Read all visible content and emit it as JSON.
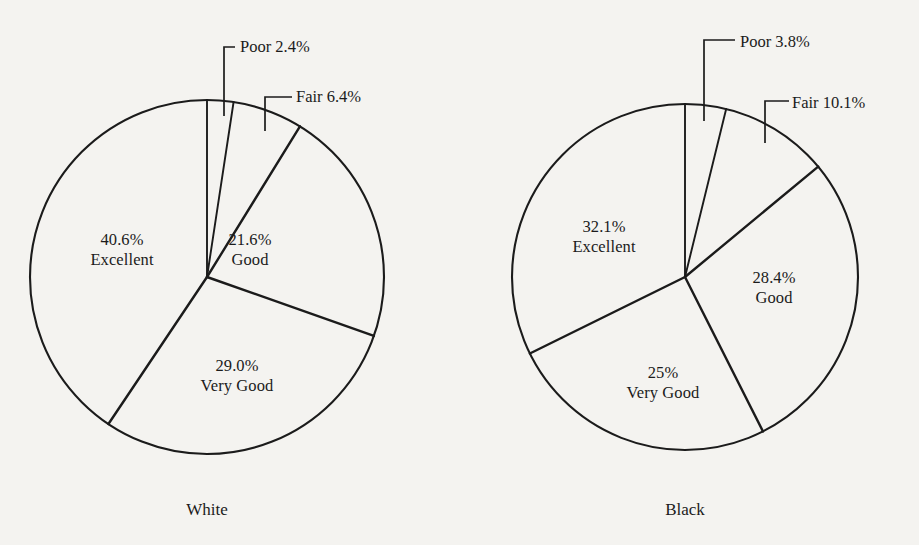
{
  "colors": {
    "background": "#f4f3f0",
    "ink": "#1b1b1b"
  },
  "chart_data": {
    "type": "pie",
    "title": "",
    "subtitle": "",
    "xlabel": "",
    "ylabel": "",
    "legend_position": "none",
    "grid": false,
    "note": "Two side-by-side pie charts of self-reported health status by race; slices ordered clockwise starting at 12 o'clock.",
    "charts": [
      {
        "caption": "White",
        "center": {
          "x": 207,
          "y": 277
        },
        "radius": 177,
        "start_angle_deg": 0,
        "direction": "clockwise",
        "categories": [
          "Poor",
          "Fair",
          "Good",
          "Very Good",
          "Excellent"
        ],
        "values": [
          2.4,
          6.4,
          21.6,
          29.0,
          40.6
        ],
        "slices": [
          {
            "name": "Poor",
            "value": 2.4,
            "value_label": "2.4%",
            "label_style": "callout"
          },
          {
            "name": "Fair",
            "value": 6.4,
            "value_label": "6.4%",
            "label_style": "callout"
          },
          {
            "name": "Good",
            "value": 21.6,
            "value_label": "21.6%",
            "label_style": "inside"
          },
          {
            "name": "Very Good",
            "value": 29.0,
            "value_label": "29.0%",
            "label_style": "inside"
          },
          {
            "name": "Excellent",
            "value": 40.6,
            "value_label": "40.6%",
            "label_style": "inside"
          }
        ],
        "inside_labels": [
          {
            "pct": "40.6%",
            "name": "Excellent",
            "x": 122,
            "y": 250
          },
          {
            "pct": "21.6%",
            "name": "Good",
            "x": 250,
            "y": 250
          },
          {
            "pct": "29.0%",
            "name": "Very Good",
            "x": 237,
            "y": 376
          }
        ],
        "callouts": [
          {
            "text": "Poor 2.4%",
            "x": 240,
            "y": 38
          },
          {
            "text": "Fair 6.4%",
            "x": 296,
            "y": 88
          }
        ]
      },
      {
        "caption": "Black",
        "center": {
          "x": 685,
          "y": 277
        },
        "radius": 173,
        "start_angle_deg": 0,
        "direction": "clockwise",
        "categories": [
          "Poor",
          "Fair",
          "Good",
          "Very Good",
          "Excellent"
        ],
        "values": [
          3.8,
          10.1,
          28.4,
          25.0,
          32.1
        ],
        "slices": [
          {
            "name": "Poor",
            "value": 3.8,
            "value_label": "3.8%",
            "label_style": "callout"
          },
          {
            "name": "Fair",
            "value": 10.1,
            "value_label": "10.1%",
            "label_style": "callout"
          },
          {
            "name": "Good",
            "value": 28.4,
            "value_label": "28.4%",
            "label_style": "inside"
          },
          {
            "name": "Very Good",
            "value": 25.0,
            "value_label": "25%",
            "label_style": "inside"
          },
          {
            "name": "Excellent",
            "value": 32.1,
            "value_label": "32.1%",
            "label_style": "inside"
          }
        ],
        "inside_labels": [
          {
            "pct": "32.1%",
            "name": "Excellent",
            "x": 604,
            "y": 237
          },
          {
            "pct": "28.4%",
            "name": "Good",
            "x": 774,
            "y": 288
          },
          {
            "pct": "25%",
            "name": "Very Good",
            "x": 663,
            "y": 383
          }
        ],
        "callouts": [
          {
            "text": "Poor 3.8%",
            "x": 740,
            "y": 33
          },
          {
            "text": "Fair 10.1%",
            "x": 792,
            "y": 94
          }
        ]
      }
    ]
  },
  "panels": [
    {
      "id": "white",
      "caption": "White",
      "caption_x": 207,
      "caption_y": 500,
      "callout_poor": "Poor 2.4%",
      "callout_fair": "Fair 6.4%",
      "label_excellent_pct": "40.6%",
      "label_excellent_name": "Excellent",
      "label_good_pct": "21.6%",
      "label_good_name": "Good",
      "label_verygood_pct": "29.0%",
      "label_verygood_name": "Very Good"
    },
    {
      "id": "black",
      "caption": "Black",
      "caption_x": 685,
      "caption_y": 500,
      "callout_poor": "Poor 3.8%",
      "callout_fair": "Fair 10.1%",
      "label_excellent_pct": "32.1%",
      "label_excellent_name": "Excellent",
      "label_good_pct": "28.4%",
      "label_good_name": "Good",
      "label_verygood_pct": "25%",
      "label_verygood_name": "Very Good"
    }
  ]
}
